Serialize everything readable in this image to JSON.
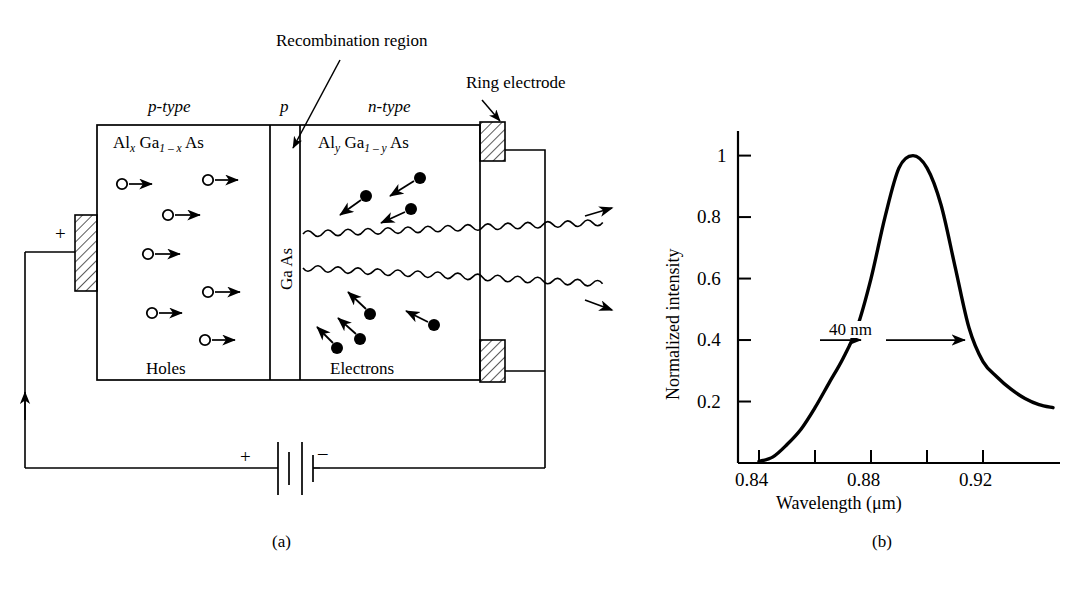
{
  "figure": {
    "panel_a": {
      "caption": "(a)",
      "callouts": {
        "recombination": "Recombination region",
        "ring_electrode": "Ring electrode"
      },
      "region_labels": {
        "p_type": "p-type",
        "junction": "p",
        "n_type": "n-type"
      },
      "materials": {
        "left": {
          "el1": "Al",
          "sub1": "x",
          "el2": "Ga",
          "sub2": "1 – x",
          "el3": "As"
        },
        "middle": "Ga As",
        "right": {
          "el1": "Al",
          "sub1": "y",
          "el2": "Ga",
          "sub2": "1 – y",
          "el3": "As"
        }
      },
      "carriers": {
        "holes_label": "Holes",
        "electrons_label": "Electrons",
        "hole_count": 7,
        "electron_count": 7
      },
      "terminals": {
        "anode": "+",
        "battery_plus": "+",
        "battery_minus": "–"
      }
    },
    "panel_b": {
      "caption": "(b)",
      "annotation": "40 nm"
    }
  },
  "chart_data": {
    "type": "line",
    "title": "",
    "xlabel": "Wavelength (μm)",
    "ylabel": "Normalized intensity",
    "xlim": [
      0.8325,
      0.9475
    ],
    "ylim": [
      0,
      1.08
    ],
    "grid": false,
    "legend": null,
    "xticks": [
      0.84,
      0.86,
      0.88,
      0.9,
      0.92
    ],
    "xticklabels": [
      "0.84",
      "",
      "0.88",
      "",
      "0.92"
    ],
    "yticks": [
      0.2,
      0.4,
      0.6,
      0.8,
      1
    ],
    "yticklabels": [
      "0.2",
      "0.4",
      "0.6",
      "0.8",
      "1"
    ],
    "annotations": [
      {
        "text": "40 nm",
        "type": "double-arrow",
        "x_start": 0.875,
        "x_end": 0.915,
        "y": 0.4
      }
    ],
    "x": [
      0.84,
      0.845,
      0.85,
      0.855,
      0.86,
      0.865,
      0.87,
      0.875,
      0.88,
      0.885,
      0.89,
      0.895,
      0.9,
      0.905,
      0.91,
      0.915,
      0.92,
      0.925,
      0.93,
      0.935,
      0.94,
      0.945
    ],
    "y": [
      0.005,
      0.02,
      0.06,
      0.11,
      0.18,
      0.26,
      0.34,
      0.44,
      0.6,
      0.8,
      0.96,
      1.0,
      0.96,
      0.84,
      0.64,
      0.44,
      0.33,
      0.28,
      0.24,
      0.21,
      0.19,
      0.18
    ]
  }
}
